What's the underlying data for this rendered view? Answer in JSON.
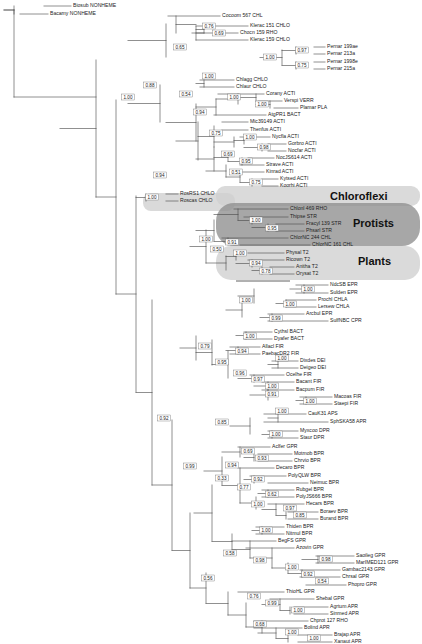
{
  "figure": {
    "type": "phylogenetic-tree",
    "title": "",
    "layout": "rectangular-cladogram",
    "support_label_type": "posterior-probability"
  },
  "group_labels": [
    {
      "name": "Chloroflexi",
      "text": "Chloroflexi",
      "font_size": 11,
      "x": 330,
      "y": 197,
      "shade": "light"
    },
    {
      "name": "Protists",
      "text": "Protists",
      "font_size": 11,
      "x": 353,
      "y": 224,
      "shade": "dark"
    },
    {
      "name": "Plants",
      "text": "Plants",
      "font_size": 11,
      "x": 358,
      "y": 262,
      "shade": "light"
    }
  ],
  "highlights": [
    {
      "name": "chloroflexi-band",
      "shade": "light",
      "x": 216,
      "y": 186,
      "w": 204,
      "h": 20,
      "r": 9
    },
    {
      "name": "rosrs-band",
      "shade": "light",
      "x": 143,
      "y": 193,
      "w": 92,
      "h": 18,
      "r": 8
    },
    {
      "name": "protists-band",
      "shade": "dark",
      "x": 216,
      "y": 203,
      "w": 204,
      "h": 43,
      "r": 18
    },
    {
      "name": "plants-band",
      "shade": "light",
      "x": 216,
      "y": 246,
      "w": 204,
      "h": 34,
      "r": 15
    }
  ],
  "taxa": [
    {
      "id": "t0",
      "label": "Biosub NONHEME",
      "x": 73,
      "y": 6
    },
    {
      "id": "t1",
      "label": "Bacamy NONHEME",
      "x": 50,
      "y": 14
    },
    {
      "id": "t2",
      "label": "Cocoom 567 CHL",
      "x": 222,
      "y": 16
    },
    {
      "id": "t3",
      "label": "Klerac 151 CHLO",
      "x": 250,
      "y": 26
    },
    {
      "id": "t4",
      "label": "Chocn 159 RHO",
      "x": 240,
      "y": 33
    },
    {
      "id": "t5",
      "label": "Klerac 159 CHLO",
      "x": 250,
      "y": 40
    },
    {
      "id": "t6",
      "label": "Pernar 199ae",
      "x": 327,
      "y": 47
    },
    {
      "id": "t7",
      "label": "Pernar 213a",
      "x": 327,
      "y": 54
    },
    {
      "id": "t8",
      "label": "Pernar 1998e",
      "x": 327,
      "y": 62
    },
    {
      "id": "t9",
      "label": "Pernar 215a",
      "x": 327,
      "y": 69
    },
    {
      "id": "t10",
      "label": "Chlagg CHLO",
      "x": 236,
      "y": 80
    },
    {
      "id": "t11",
      "label": "Chlaur CHLO",
      "x": 236,
      "y": 87
    },
    {
      "id": "t12",
      "label": "Corany ACTI",
      "x": 266,
      "y": 94
    },
    {
      "id": "t13",
      "label": "Verspi VERR",
      "x": 284,
      "y": 101
    },
    {
      "id": "t14",
      "label": "Plamar PLA",
      "x": 300,
      "y": 108
    },
    {
      "id": "t15",
      "label": "AtgPR1 BACT",
      "x": 268,
      "y": 115
    },
    {
      "id": "t16",
      "label": "Mic39149 ACTI",
      "x": 250,
      "y": 122
    },
    {
      "id": "t17",
      "label": "Thenfus ACTI",
      "x": 250,
      "y": 130
    },
    {
      "id": "t18",
      "label": "Nycfla ACTI",
      "x": 272,
      "y": 137
    },
    {
      "id": "t19",
      "label": "Gorbro ACTI",
      "x": 288,
      "y": 144
    },
    {
      "id": "t20",
      "label": "Nocfar ACTI",
      "x": 288,
      "y": 151
    },
    {
      "id": "t21",
      "label": "NocJS614 ACTI",
      "x": 276,
      "y": 158
    },
    {
      "id": "t22",
      "label": "Strave ACTI",
      "x": 266,
      "y": 165
    },
    {
      "id": "t23",
      "label": "Kinrad ACTI",
      "x": 266,
      "y": 172
    },
    {
      "id": "t24",
      "label": "Kytsed ACTI",
      "x": 280,
      "y": 179
    },
    {
      "id": "t25",
      "label": "Koorhi ACTI",
      "x": 280,
      "y": 186
    },
    {
      "id": "t26",
      "label": "RosRS1 CHLO",
      "x": 180,
      "y": 194
    },
    {
      "id": "t27",
      "label": "Roscas CHLO",
      "x": 180,
      "y": 201
    },
    {
      "id": "t28",
      "label": "Chlonl 469 RHO",
      "x": 290,
      "y": 209
    },
    {
      "id": "t29",
      "label": "Thipse STR",
      "x": 290,
      "y": 217
    },
    {
      "id": "t30",
      "label": "Fracyl 139 STR",
      "x": 306,
      "y": 224
    },
    {
      "id": "t31",
      "label": "Phsarl STR",
      "x": 306,
      "y": 231
    },
    {
      "id": "t32",
      "label": "ChlorNC 244 CHL",
      "x": 290,
      "y": 238
    },
    {
      "id": "t33",
      "label": "ChlorNC 161 CHL",
      "x": 312,
      "y": 245
    },
    {
      "id": "t34",
      "label": "Physal T2",
      "x": 286,
      "y": 253
    },
    {
      "id": "t35",
      "label": "Ricown T2",
      "x": 286,
      "y": 260
    },
    {
      "id": "t36",
      "label": "Anitha T2",
      "x": 296,
      "y": 267
    },
    {
      "id": "t37",
      "label": "Orysat T2",
      "x": 296,
      "y": 274
    },
    {
      "id": "t38",
      "label": "NdcSB EPR",
      "x": 330,
      "y": 285
    },
    {
      "id": "t39",
      "label": "Sulden EPR",
      "x": 330,
      "y": 293
    },
    {
      "id": "t40",
      "label": "Prochl CHLA",
      "x": 318,
      "y": 300
    },
    {
      "id": "t41",
      "label": "Lersew CHLA",
      "x": 318,
      "y": 307
    },
    {
      "id": "t42",
      "label": "Arcbul EPR",
      "x": 306,
      "y": 314
    },
    {
      "id": "t43",
      "label": "SulfNBC CPR",
      "x": 330,
      "y": 321
    },
    {
      "id": "t44",
      "label": "Cythsl BACT",
      "x": 274,
      "y": 332
    },
    {
      "id": "t45",
      "label": "Dyafer BACT",
      "x": 274,
      "y": 339
    },
    {
      "id": "t46",
      "label": "Allacl FIR",
      "x": 262,
      "y": 347
    },
    {
      "id": "t47",
      "label": "PaebacDR2 FIR",
      "x": 262,
      "y": 354
    },
    {
      "id": "t48",
      "label": "Dixdes DEI",
      "x": 300,
      "y": 361
    },
    {
      "id": "t49",
      "label": "Deigeo DEI",
      "x": 300,
      "y": 368
    },
    {
      "id": "t50",
      "label": "Ocelhe FIR",
      "x": 286,
      "y": 375
    },
    {
      "id": "t51",
      "label": "Bacant FIR",
      "x": 296,
      "y": 382
    },
    {
      "id": "t52",
      "label": "Bacpum FIR",
      "x": 296,
      "y": 390
    },
    {
      "id": "t53",
      "label": "Macoas FIR",
      "x": 334,
      "y": 397
    },
    {
      "id": "t54",
      "label": "Staepi FIR",
      "x": 334,
      "y": 404
    },
    {
      "id": "t55",
      "label": "CauK31 APS",
      "x": 308,
      "y": 414
    },
    {
      "id": "t56",
      "label": "SphSKA58 APR",
      "x": 330,
      "y": 422
    },
    {
      "id": "t57",
      "label": "Myxcoo DPR",
      "x": 300,
      "y": 431
    },
    {
      "id": "t58",
      "label": "Staur DPR",
      "x": 300,
      "y": 438
    },
    {
      "id": "t59",
      "label": "Aclfer GPR",
      "x": 272,
      "y": 447
    },
    {
      "id": "t60",
      "label": "Motmob BPR",
      "x": 294,
      "y": 454
    },
    {
      "id": "t61",
      "label": "Chrvio BPR",
      "x": 294,
      "y": 461
    },
    {
      "id": "t62",
      "label": "Decaro BPR",
      "x": 276,
      "y": 468
    },
    {
      "id": "t63",
      "label": "PolyQLW BPR",
      "x": 288,
      "y": 476
    },
    {
      "id": "t64",
      "label": "Neimuc BPR",
      "x": 310,
      "y": 483
    },
    {
      "id": "t65",
      "label": "Rubgel BPR",
      "x": 296,
      "y": 490
    },
    {
      "id": "t66",
      "label": "PolyJS666 BPR",
      "x": 296,
      "y": 497
    },
    {
      "id": "t67",
      "label": "Hecars BPR",
      "x": 306,
      "y": 504
    },
    {
      "id": "t68",
      "label": "Boraev BPR",
      "x": 320,
      "y": 512
    },
    {
      "id": "t69",
      "label": "Burand BPR",
      "x": 320,
      "y": 519
    },
    {
      "id": "t70",
      "label": "Thiden BPR",
      "x": 286,
      "y": 527
    },
    {
      "id": "t71",
      "label": "Nitmul BPR",
      "x": 286,
      "y": 534
    },
    {
      "id": "t72",
      "label": "BegFS GPR",
      "x": 278,
      "y": 541
    },
    {
      "id": "t73",
      "label": "Azovin GPR",
      "x": 296,
      "y": 548
    },
    {
      "id": "t74",
      "label": "Saoileg GPR",
      "x": 356,
      "y": 556
    },
    {
      "id": "t75",
      "label": "MarIMED121 GPR",
      "x": 356,
      "y": 563
    },
    {
      "id": "t76",
      "label": "Gambac2143 GPR",
      "x": 342,
      "y": 570
    },
    {
      "id": "t77",
      "label": "Chrsal GPR",
      "x": 342,
      "y": 577
    },
    {
      "id": "t78",
      "label": "Phopro GPR",
      "x": 348,
      "y": 585
    },
    {
      "id": "t79",
      "label": "ThioHL GPR",
      "x": 286,
      "y": 592
    },
    {
      "id": "t80",
      "label": "Shebal GPR",
      "x": 316,
      "y": 599
    },
    {
      "id": "t81",
      "label": "Agrtum APR",
      "x": 330,
      "y": 607
    },
    {
      "id": "t82",
      "label": "Sinmed APR",
      "x": 330,
      "y": 614
    },
    {
      "id": "t83",
      "label": "Chprot 127 RHO",
      "x": 310,
      "y": 621
    },
    {
      "id": "t84",
      "label": "Bolind APR",
      "x": 304,
      "y": 628
    },
    {
      "id": "t85",
      "label": "Brajap APR",
      "x": 334,
      "y": 635
    },
    {
      "id": "t86",
      "label": "Xanaut APR",
      "x": 334,
      "y": 642
    }
  ],
  "support_values": [
    {
      "id": "s0",
      "value": "1.00",
      "x": 128,
      "y": 97
    },
    {
      "id": "s1",
      "value": "0.88",
      "x": 150,
      "y": 85
    },
    {
      "id": "s2",
      "value": "0.65",
      "x": 180,
      "y": 47
    },
    {
      "id": "s3",
      "value": "0.76",
      "x": 209,
      "y": 26
    },
    {
      "id": "s4",
      "value": "0.69",
      "x": 219,
      "y": 33
    },
    {
      "id": "s5",
      "value": "1.00",
      "x": 270,
      "y": 57
    },
    {
      "id": "s6",
      "value": "0.97",
      "x": 302,
      "y": 50
    },
    {
      "id": "s7",
      "value": "0.75",
      "x": 302,
      "y": 65
    },
    {
      "id": "s8",
      "value": "1.00",
      "x": 209,
      "y": 76
    },
    {
      "id": "s9",
      "value": "0.54",
      "x": 186,
      "y": 94
    },
    {
      "id": "s10",
      "value": "1.00",
      "x": 234,
      "y": 97
    },
    {
      "id": "s11",
      "value": "1.00",
      "x": 262,
      "y": 104
    },
    {
      "id": "s12",
      "value": "0.94",
      "x": 200,
      "y": 112
    },
    {
      "id": "s13",
      "value": "0.75",
      "x": 216,
      "y": 133
    },
    {
      "id": "s14",
      "value": "1.00",
      "x": 250,
      "y": 137
    },
    {
      "id": "s15",
      "value": "0.98",
      "x": 264,
      "y": 147
    },
    {
      "id": "s16",
      "value": "0.69",
      "x": 228,
      "y": 154
    },
    {
      "id": "s17",
      "value": "0.95",
      "x": 246,
      "y": 161
    },
    {
      "id": "s18",
      "value": "0.51",
      "x": 236,
      "y": 172
    },
    {
      "id": "s19",
      "value": "0.75",
      "x": 256,
      "y": 182
    },
    {
      "id": "s20",
      "value": "0.94",
      "x": 160,
      "y": 175
    },
    {
      "id": "s21",
      "value": "1.00",
      "x": 152,
      "y": 197
    },
    {
      "id": "s22",
      "value": "1.00",
      "x": 256,
      "y": 220
    },
    {
      "id": "s23",
      "value": "0.95",
      "x": 272,
      "y": 228
    },
    {
      "id": "s24",
      "value": "0.91",
      "x": 232,
      "y": 242
    },
    {
      "id": "s25",
      "value": "1.00",
      "x": 240,
      "y": 253
    },
    {
      "id": "s26",
      "value": "0.94",
      "x": 256,
      "y": 263
    },
    {
      "id": "s27",
      "value": "0.78",
      "x": 266,
      "y": 271
    },
    {
      "id": "s28",
      "value": "1.00",
      "x": 206,
      "y": 239
    },
    {
      "id": "s29",
      "value": "0.50",
      "x": 217,
      "y": 249
    },
    {
      "id": "s30",
      "value": "1.00",
      "x": 308,
      "y": 289
    },
    {
      "id": "s31",
      "value": "1.00",
      "x": 246,
      "y": 300
    },
    {
      "id": "s32",
      "value": "1.00",
      "x": 290,
      "y": 304
    },
    {
      "id": "s33",
      "value": "0.99",
      "x": 276,
      "y": 318
    },
    {
      "id": "s34",
      "value": "1.00",
      "x": 250,
      "y": 336
    },
    {
      "id": "s35",
      "value": "0.79",
      "x": 205,
      "y": 346
    },
    {
      "id": "s36",
      "value": "0.95",
      "x": 222,
      "y": 362
    },
    {
      "id": "s37",
      "value": "0.94",
      "x": 242,
      "y": 351
    },
    {
      "id": "s38",
      "value": "1.00",
      "x": 282,
      "y": 358
    },
    {
      "id": "s39",
      "value": "0.96",
      "x": 240,
      "y": 373
    },
    {
      "id": "s40",
      "value": "0.97",
      "x": 258,
      "y": 379
    },
    {
      "id": "s41",
      "value": "1.00",
      "x": 272,
      "y": 386
    },
    {
      "id": "s42",
      "value": "0.91",
      "x": 272,
      "y": 394
    },
    {
      "id": "s43",
      "value": "1.00",
      "x": 310,
      "y": 401
    },
    {
      "id": "s44",
      "value": "0.92",
      "x": 164,
      "y": 418
    },
    {
      "id": "s45",
      "value": "1.00",
      "x": 282,
      "y": 411
    },
    {
      "id": "s46",
      "value": "0.85",
      "x": 222,
      "y": 422
    },
    {
      "id": "s47",
      "value": "1.00",
      "x": 276,
      "y": 434
    },
    {
      "id": "s48",
      "value": "0.69",
      "x": 248,
      "y": 451
    },
    {
      "id": "s49",
      "value": "0.93",
      "x": 262,
      "y": 458
    },
    {
      "id": "s50",
      "value": "0.94",
      "x": 232,
      "y": 465
    },
    {
      "id": "s51",
      "value": "0.92",
      "x": 258,
      "y": 479
    },
    {
      "id": "s52",
      "value": "0.33",
      "x": 222,
      "y": 478
    },
    {
      "id": "s53",
      "value": "0.77",
      "x": 244,
      "y": 487
    },
    {
      "id": "s54",
      "value": "0.62",
      "x": 272,
      "y": 494
    },
    {
      "id": "s55",
      "value": "1.00",
      "x": 258,
      "y": 504
    },
    {
      "id": "s56",
      "value": "0.97",
      "x": 290,
      "y": 508
    },
    {
      "id": "s57",
      "value": "0.85",
      "x": 300,
      "y": 515
    },
    {
      "id": "s58",
      "value": "1.00",
      "x": 266,
      "y": 530
    },
    {
      "id": "s59",
      "value": "0.58",
      "x": 230,
      "y": 553
    },
    {
      "id": "s60",
      "value": "0.98",
      "x": 260,
      "y": 560
    },
    {
      "id": "s61",
      "value": "0.98",
      "x": 326,
      "y": 559
    },
    {
      "id": "s62",
      "value": "1.00",
      "x": 292,
      "y": 567
    },
    {
      "id": "s63",
      "value": "0.92",
      "x": 308,
      "y": 574
    },
    {
      "id": "s64",
      "value": "0.54",
      "x": 322,
      "y": 581
    },
    {
      "id": "s65",
      "value": "0.56",
      "x": 208,
      "y": 578
    },
    {
      "id": "s66",
      "value": "0.99",
      "x": 190,
      "y": 466
    },
    {
      "id": "s67",
      "value": "0.76",
      "x": 254,
      "y": 596
    },
    {
      "id": "s68",
      "value": "0.99",
      "x": 272,
      "y": 603
    },
    {
      "id": "s69",
      "value": "1.00",
      "x": 298,
      "y": 610
    },
    {
      "id": "s70",
      "value": "0.68",
      "x": 260,
      "y": 624
    },
    {
      "id": "s71",
      "value": "1.00",
      "x": 292,
      "y": 632
    },
    {
      "id": "s72",
      "value": "1.00",
      "x": 314,
      "y": 638
    }
  ],
  "colors": {
    "branch": "#4a4a4a",
    "text": "#222222",
    "highlight_dark": "#8e8e8e",
    "highlight_light": "#cfcfcf",
    "background": "#ffffff"
  }
}
